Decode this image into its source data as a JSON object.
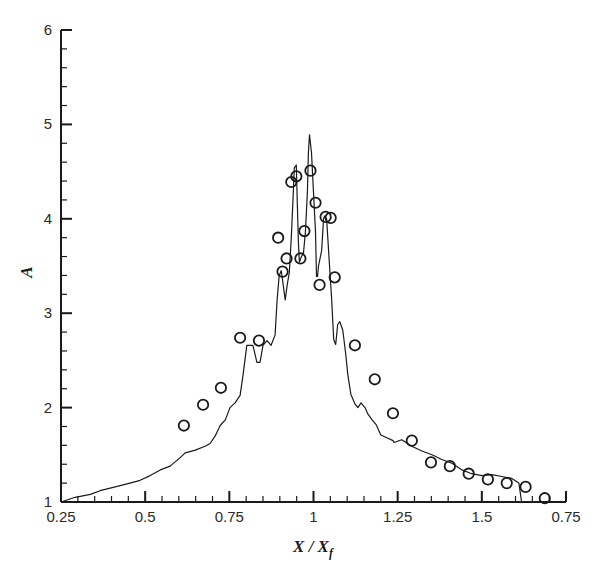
{
  "chart_data": {
    "type": "line",
    "title": "",
    "xlabel": "X / X_f",
    "xlabel_main": "X / X",
    "xlabel_sub": "f",
    "ylabel": "A",
    "xlim": [
      0.25,
      1.75
    ],
    "ylim": [
      1,
      6
    ],
    "grid": false,
    "legend": null,
    "x_ticks": [
      0.25,
      0.5,
      0.75,
      1.0,
      1.25,
      1.5,
      1.75
    ],
    "x_tick_labels": [
      "0.25",
      "0.5",
      "0.75",
      "1",
      "1.25",
      "1.5",
      "0.75"
    ],
    "y_ticks": [
      1,
      2,
      3,
      4,
      5,
      6
    ],
    "y_tick_labels": [
      "1",
      "2",
      "3",
      "4",
      "5",
      "6"
    ],
    "x_minor_step": 0.05,
    "y_minor_step": 0.2,
    "series": [
      {
        "name": "simulation",
        "style": "line",
        "color": "#1a1a1a",
        "x": [
          0.25,
          0.292,
          0.337,
          0.366,
          0.411,
          0.455,
          0.485,
          0.515,
          0.545,
          0.574,
          0.604,
          0.619,
          0.649,
          0.678,
          0.693,
          0.708,
          0.723,
          0.738,
          0.752,
          0.767,
          0.782,
          0.791,
          0.802,
          0.82,
          0.832,
          0.841,
          0.85,
          0.862,
          0.874,
          0.886,
          0.892,
          0.898,
          0.904,
          0.91,
          0.916,
          0.922,
          0.928,
          0.934,
          0.94,
          0.943,
          0.949,
          0.952,
          0.955,
          0.958,
          0.964,
          0.97,
          0.976,
          0.982,
          0.985,
          0.988,
          0.994,
          1.0,
          1.006,
          1.009,
          1.012,
          1.015,
          1.024,
          1.03,
          1.033,
          1.039,
          1.045,
          1.054,
          1.06,
          1.066,
          1.072,
          1.078,
          1.087,
          1.096,
          1.102,
          1.111,
          1.123,
          1.132,
          1.141,
          1.153,
          1.162,
          1.174,
          1.186,
          1.2,
          1.218,
          1.236,
          1.239,
          1.262,
          1.292,
          1.322,
          1.352,
          1.381,
          1.411,
          1.441,
          1.47,
          1.5,
          1.53,
          1.559,
          1.589,
          1.61,
          1.618
        ],
        "y": [
          1.0,
          1.05,
          1.08,
          1.12,
          1.16,
          1.2,
          1.23,
          1.28,
          1.34,
          1.38,
          1.47,
          1.52,
          1.55,
          1.59,
          1.62,
          1.7,
          1.81,
          1.87,
          2.0,
          2.05,
          2.13,
          2.35,
          2.66,
          2.66,
          2.48,
          2.48,
          2.66,
          2.71,
          2.66,
          2.77,
          3.14,
          3.4,
          3.45,
          3.3,
          3.14,
          3.3,
          3.43,
          3.8,
          4.28,
          4.54,
          4.57,
          4.17,
          3.75,
          3.54,
          3.6,
          3.63,
          3.86,
          4.28,
          4.7,
          4.89,
          4.7,
          4.28,
          3.86,
          3.39,
          3.39,
          3.5,
          3.66,
          4.0,
          4.03,
          4.0,
          3.66,
          3.14,
          2.72,
          2.67,
          2.88,
          2.91,
          2.82,
          2.56,
          2.35,
          2.14,
          2.04,
          2.0,
          2.05,
          2.0,
          1.93,
          1.87,
          1.82,
          1.71,
          1.68,
          1.65,
          1.63,
          1.66,
          1.59,
          1.54,
          1.5,
          1.45,
          1.41,
          1.34,
          1.3,
          1.28,
          1.29,
          1.27,
          1.25,
          1.2,
          1.0
        ]
      },
      {
        "name": "experiment",
        "style": "marker",
        "marker": "open-circle",
        "color": "#1a1a1a",
        "x": [
          0.615,
          0.672,
          0.725,
          0.782,
          0.838,
          0.895,
          0.908,
          0.92,
          0.934,
          0.949,
          0.961,
          0.973,
          0.991,
          1.006,
          1.018,
          1.036,
          1.051,
          1.063,
          1.123,
          1.182,
          1.236,
          1.292,
          1.349,
          1.405,
          1.461,
          1.518,
          1.574,
          1.63,
          1.687
        ],
        "y": [
          1.81,
          2.03,
          2.21,
          2.74,
          2.71,
          3.8,
          3.44,
          3.58,
          4.39,
          4.45,
          3.58,
          3.87,
          4.51,
          4.17,
          3.3,
          4.02,
          4.01,
          3.38,
          2.66,
          2.3,
          1.94,
          1.65,
          1.42,
          1.38,
          1.3,
          1.24,
          1.2,
          1.16,
          1.04
        ]
      }
    ]
  },
  "layout": {
    "plot_left_px": 61,
    "plot_right_px": 566,
    "plot_top_px": 30,
    "plot_bottom_px": 502
  }
}
